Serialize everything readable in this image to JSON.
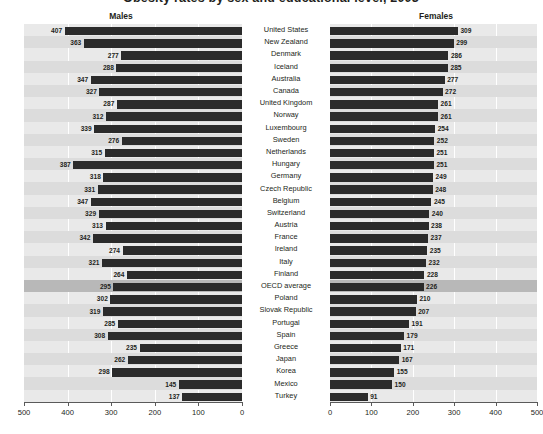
{
  "title": "Obesity rates by sex and educational level, 2003",
  "panels": {
    "left": {
      "heading": "Males"
    },
    "right": {
      "heading": "Females"
    }
  },
  "axis": {
    "left_ticks": [
      "500",
      "400",
      "300",
      "200",
      "100",
      "0"
    ],
    "right_ticks": [
      "0",
      "100",
      "200",
      "300",
      "400",
      "500"
    ],
    "max": 500,
    "min": 0
  },
  "chart_data": {
    "type": "bar",
    "title": "Obesity rates by sex and educational level, 2003",
    "subcharts": [
      "Males",
      "Females"
    ],
    "orientation": "horizontal-diverging",
    "categories": [
      "United States",
      "New Zealand",
      "Denmark",
      "Iceland",
      "Australia",
      "Canada",
      "United Kingdom",
      "Norway",
      "Luxembourg",
      "Sweden",
      "Netherlands",
      "Hungary",
      "Germany",
      "Czech Republic",
      "Belgium",
      "Switzerland",
      "Austria",
      "France",
      "Ireland",
      "Italy",
      "Finland",
      "OECD average",
      "Poland",
      "Slovak Republic",
      "Portugal",
      "Spain",
      "Greece",
      "Japan",
      "Korea",
      "Mexico",
      "Turkey"
    ],
    "series": [
      {
        "name": "Males",
        "values": [
          407,
          363,
          277,
          288,
          347,
          327,
          287,
          312,
          339,
          276,
          315,
          387,
          318,
          331,
          347,
          329,
          313,
          342,
          274,
          321,
          264,
          295,
          302,
          319,
          285,
          308,
          235,
          262,
          298,
          145,
          137
        ]
      },
      {
        "name": "Females",
        "values": [
          309,
          299,
          286,
          285,
          277,
          272,
          261,
          261,
          254,
          252,
          251,
          251,
          249,
          248,
          245,
          240,
          238,
          237,
          235,
          232,
          228,
          226,
          210,
          207,
          191,
          179,
          171,
          167,
          155,
          150,
          91
        ]
      }
    ],
    "highlight_row": "OECD average",
    "xlabel": "",
    "ylabel": "",
    "xlim": [
      0,
      500
    ],
    "grid": true,
    "legend": "none"
  },
  "colors": {
    "bar": "#2b2b2b",
    "plot_background": "#e9e9e9",
    "band": "#dcdcdc",
    "highlight_band": "#b8b8b8",
    "gridline": "#ffffff",
    "axis": "#5a5a5a",
    "text": "#231f20"
  }
}
